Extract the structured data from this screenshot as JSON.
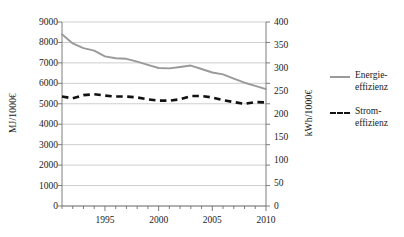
{
  "chart_data": {
    "type": "line",
    "title": "",
    "xlabel": "",
    "ylabel": "MJ/1000€",
    "ylabel_secondary": "kWh/1000€",
    "grid": true,
    "legend_position": "right",
    "xlim": [
      1991,
      2010
    ],
    "ylim": [
      0,
      9000
    ],
    "ylim_secondary": [
      0,
      400
    ],
    "yticks": [
      0,
      1000,
      2000,
      3000,
      4000,
      5000,
      6000,
      7000,
      8000,
      9000
    ],
    "ytick_labels": [
      "0",
      "1000",
      "2000",
      "3000",
      "4000",
      "5000",
      "6000",
      "7000",
      "8000",
      "9000"
    ],
    "yticks_secondary": [
      0,
      50,
      100,
      150,
      200,
      250,
      300,
      350,
      400
    ],
    "ytick_labels_secondary": [
      "0",
      "50",
      "100",
      "150",
      "200",
      "250",
      "300",
      "350",
      "400"
    ],
    "xticks": [
      1995,
      2000,
      2005,
      2010
    ],
    "xtick_labels": [
      "1995",
      "2000",
      "2005",
      "2010"
    ],
    "xminor_ticks": [
      1991,
      1992,
      1993,
      1994,
      1995,
      1996,
      1997,
      1998,
      1999,
      2000,
      2001,
      2002,
      2003,
      2004,
      2005,
      2006,
      2007,
      2008,
      2009,
      2010
    ],
    "x": [
      1991,
      1992,
      1993,
      1994,
      1995,
      1996,
      1997,
      1998,
      1999,
      2000,
      2001,
      2002,
      2003,
      2004,
      2005,
      2006,
      2007,
      2008,
      2009,
      2010
    ],
    "series": [
      {
        "name": "Energie-\neffizienz",
        "axis": "left",
        "unit": "MJ/1000€",
        "style": "solid",
        "color": "#9a9a9a",
        "values": [
          8400,
          7950,
          7720,
          7600,
          7320,
          7230,
          7200,
          7060,
          6900,
          6750,
          6730,
          6800,
          6870,
          6700,
          6530,
          6440,
          6230,
          6030,
          5880,
          5720
        ]
      },
      {
        "name": "Strom-\neffizienz",
        "axis": "right",
        "unit": "kWh/1000€",
        "style": "dashed",
        "color": "#111111",
        "values": [
          238,
          234,
          241,
          243,
          240,
          238,
          238,
          236,
          232,
          229,
          229,
          232,
          239,
          239,
          236,
          230,
          226,
          222,
          226,
          225
        ],
        "values_left_scale_equivalent": [
          5360,
          5260,
          5420,
          5470,
          5400,
          5350,
          5350,
          5310,
          5220,
          5150,
          5150,
          5220,
          5380,
          5380,
          5310,
          5170,
          5080,
          5000,
          5080,
          5060
        ]
      }
    ]
  },
  "axes": {
    "left_title": "MJ/1000€",
    "right_title": "kWh/1000€"
  },
  "legend": {
    "items": [
      {
        "label": "Energie-\neffizienz",
        "style": "solid",
        "color": "#9a9a9a"
      },
      {
        "label": "Strom-\neffizienz",
        "style": "dashed",
        "color": "#111111"
      }
    ]
  }
}
